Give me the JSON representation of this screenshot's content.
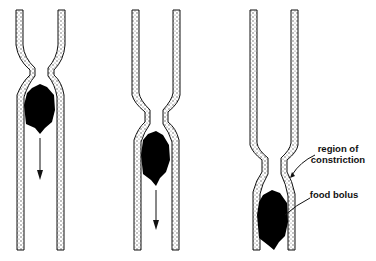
{
  "figure": {
    "stages": [
      {
        "id": "stage-1",
        "constriction_y": 72,
        "bolus_y": 85,
        "arrow": true
      },
      {
        "id": "stage-2",
        "constriction_y": 117,
        "bolus_y": 130,
        "arrow": true
      },
      {
        "id": "stage-3",
        "constriction_y": 165,
        "bolus_y": 190,
        "arrow": false
      }
    ],
    "labels": {
      "constriction": "region of\nconstriction",
      "constriction_line1": "region of",
      "constriction_line2": "constriction",
      "bolus": "food bolus"
    },
    "colors": {
      "ink": "#111111",
      "wall_fill": "#ffffff",
      "bolus": "#000000"
    }
  }
}
